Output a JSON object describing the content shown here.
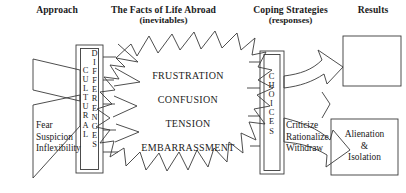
{
  "diagram": {
    "title_hidden": "Culture shock process diagram",
    "columns": [
      {
        "id": "approach",
        "title": "Approach",
        "subtitle": ""
      },
      {
        "id": "facts",
        "title": "The Facts of Life Abroad",
        "subtitle": "(inevitables)"
      },
      {
        "id": "coping",
        "title": "Coping Strategies",
        "subtitle": "(responses)"
      },
      {
        "id": "results",
        "title": "Results",
        "subtitle": ""
      }
    ],
    "left_upper_wedge": {
      "text": ""
    },
    "left_lower_wedge": {
      "lines": [
        "Fear",
        "Suspicion",
        "Inflexibility"
      ]
    },
    "cultural_bar": {
      "left_column": "CULTURAL",
      "right_column": "DIFFERENCES"
    },
    "burst": {
      "items": [
        "FRUSTRATION",
        "CONFUSION",
        "TENSION",
        "EMBARRASSMENT"
      ]
    },
    "choices_bar": {
      "column": "CHOICES"
    },
    "coping_text": {
      "lines": [
        "Criticize",
        "Rationalize",
        "Withdraw"
      ]
    },
    "result_top_box": {
      "lines": []
    },
    "result_bottom_box": {
      "lines": [
        "Alienation",
        "&",
        "Isolation"
      ]
    },
    "colors": {
      "stroke": "#3a3a3a",
      "text": "#1b1b1b",
      "background": "#ffffff"
    }
  }
}
